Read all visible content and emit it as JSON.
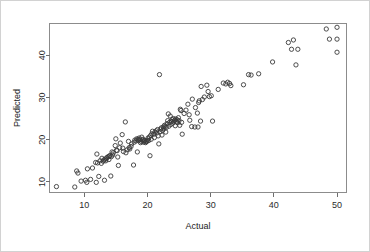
{
  "figure": {
    "background_color": "#ffffff",
    "frame_color": "#8c8c8c",
    "outer_border_color": "#d2d2d2",
    "point_color": "#3a3a3a"
  },
  "chart_data": {
    "type": "scatter",
    "title": "",
    "xlabel": "Actual",
    "ylabel": "Predicted",
    "xlim": [
      4.5,
      51.5
    ],
    "ylim": [
      7.5,
      47.5
    ],
    "xticks": [
      10,
      20,
      30,
      40,
      50
    ],
    "yticks": [
      10,
      20,
      30,
      40
    ],
    "xtick_labels": [
      "10",
      "20",
      "30",
      "40",
      "50"
    ],
    "ytick_labels": [
      "10",
      "20",
      "30",
      "40"
    ],
    "grid": false,
    "legend": null,
    "marker": "open-circle",
    "marker_size": 3.1,
    "series": [
      {
        "name": "Predicted vs Actual",
        "points": [
          [
            5.6,
            8.9
          ],
          [
            8.5,
            8.8
          ],
          [
            8.8,
            12.6
          ],
          [
            9.0,
            12.1
          ],
          [
            9.5,
            10.2
          ],
          [
            10.2,
            10.4
          ],
          [
            10.4,
            9.9
          ],
          [
            10.5,
            13.1
          ],
          [
            11.0,
            10.6
          ],
          [
            11.3,
            13.3
          ],
          [
            11.8,
            14.6
          ],
          [
            11.9,
            9.9
          ],
          [
            12.0,
            16.6
          ],
          [
            12.1,
            14.5
          ],
          [
            12.3,
            11.3
          ],
          [
            12.5,
            15.0
          ],
          [
            12.7,
            14.4
          ],
          [
            12.8,
            15.6
          ],
          [
            13.0,
            14.9
          ],
          [
            13.1,
            15.2
          ],
          [
            13.2,
            10.4
          ],
          [
            13.3,
            15.4
          ],
          [
            13.4,
            15.0
          ],
          [
            13.5,
            15.5
          ],
          [
            13.6,
            15.8
          ],
          [
            13.8,
            16.0
          ],
          [
            13.9,
            15.3
          ],
          [
            14.0,
            16.1
          ],
          [
            14.1,
            16.3
          ],
          [
            14.2,
            11.4
          ],
          [
            14.3,
            16.0
          ],
          [
            14.4,
            17.1
          ],
          [
            14.5,
            16.4
          ],
          [
            14.6,
            16.9
          ],
          [
            14.9,
            18.6
          ],
          [
            15.0,
            20.2
          ],
          [
            15.1,
            17.5
          ],
          [
            15.2,
            17.4
          ],
          [
            15.3,
            15.9
          ],
          [
            15.4,
            13.9
          ],
          [
            15.6,
            18.1
          ],
          [
            15.7,
            19.2
          ],
          [
            16.0,
            21.2
          ],
          [
            16.1,
            18.0
          ],
          [
            16.2,
            17.2
          ],
          [
            16.5,
            24.2
          ],
          [
            16.6,
            16.9
          ],
          [
            16.8,
            17.6
          ],
          [
            17.0,
            19.6
          ],
          [
            17.1,
            18.1
          ],
          [
            17.2,
            17.8
          ],
          [
            17.4,
            18.4
          ],
          [
            17.5,
            19.0
          ],
          [
            17.8,
            14.0
          ],
          [
            17.9,
            19.4
          ],
          [
            18.0,
            19.9
          ],
          [
            18.2,
            19.7
          ],
          [
            18.3,
            20.2
          ],
          [
            18.4,
            17.1
          ],
          [
            18.5,
            20.1
          ],
          [
            18.6,
            19.8
          ],
          [
            18.7,
            20.4
          ],
          [
            18.8,
            20.0
          ],
          [
            18.9,
            19.3
          ],
          [
            19.0,
            19.6
          ],
          [
            19.1,
            20.6
          ],
          [
            19.2,
            19.9
          ],
          [
            19.3,
            20.1
          ],
          [
            19.4,
            19.4
          ],
          [
            19.5,
            19.7
          ],
          [
            19.6,
            19.8
          ],
          [
            19.7,
            19.3
          ],
          [
            19.8,
            19.5
          ],
          [
            19.9,
            19.6
          ],
          [
            20.0,
            19.9
          ],
          [
            20.1,
            20.4
          ],
          [
            20.2,
            19.8
          ],
          [
            20.3,
            20.6
          ],
          [
            20.4,
            16.2
          ],
          [
            20.5,
            21.0
          ],
          [
            20.6,
            20.1
          ],
          [
            20.7,
            21.4
          ],
          [
            20.8,
            22.0
          ],
          [
            21.0,
            21.3
          ],
          [
            21.1,
            20.5
          ],
          [
            21.2,
            21.8
          ],
          [
            21.4,
            22.1
          ],
          [
            21.5,
            21.6
          ],
          [
            21.6,
            22.4
          ],
          [
            21.7,
            20.9
          ],
          [
            21.8,
            19.0
          ],
          [
            21.9,
            35.4
          ],
          [
            22.0,
            21.9
          ],
          [
            22.1,
            22.5
          ],
          [
            22.2,
            22.8
          ],
          [
            22.3,
            21.1
          ],
          [
            22.4,
            22.2
          ],
          [
            22.5,
            23.0
          ],
          [
            22.6,
            22.6
          ],
          [
            22.7,
            23.4
          ],
          [
            22.8,
            23.1
          ],
          [
            22.9,
            21.8
          ],
          [
            23.0,
            22.9
          ],
          [
            23.1,
            23.8
          ],
          [
            23.2,
            24.5
          ],
          [
            23.3,
            26.1
          ],
          [
            23.4,
            23.2
          ],
          [
            23.5,
            24.1
          ],
          [
            23.6,
            25.6
          ],
          [
            23.7,
            23.6
          ],
          [
            23.8,
            24.3
          ],
          [
            23.9,
            24.8
          ],
          [
            24.0,
            23.9
          ],
          [
            24.1,
            25.0
          ],
          [
            24.2,
            24.4
          ],
          [
            24.3,
            24.6
          ],
          [
            24.4,
            23.3
          ],
          [
            24.5,
            24.9
          ],
          [
            24.6,
            24.2
          ],
          [
            24.7,
            24.7
          ],
          [
            24.8,
            24.0
          ],
          [
            24.9,
            25.2
          ],
          [
            25.0,
            24.5
          ],
          [
            25.1,
            23.4
          ],
          [
            25.2,
            27.2
          ],
          [
            25.3,
            26.9
          ],
          [
            25.4,
            24.1
          ],
          [
            25.5,
            21.3
          ],
          [
            25.8,
            26.2
          ],
          [
            26.1,
            27.0
          ],
          [
            26.4,
            28.4
          ],
          [
            26.6,
            25.9
          ],
          [
            26.7,
            24.6
          ],
          [
            27.0,
            23.1
          ],
          [
            27.1,
            29.6
          ],
          [
            27.5,
            23.0
          ],
          [
            27.6,
            27.6
          ],
          [
            27.9,
            26.3
          ],
          [
            28.0,
            23.0
          ],
          [
            28.1,
            28.8
          ],
          [
            28.2,
            29.2
          ],
          [
            28.4,
            24.4
          ],
          [
            28.5,
            32.6
          ],
          [
            28.7,
            29.5
          ],
          [
            29.0,
            30.1
          ],
          [
            29.4,
            32.9
          ],
          [
            29.6,
            31.4
          ],
          [
            29.8,
            30.2
          ],
          [
            30.1,
            30.4
          ],
          [
            30.3,
            24.4
          ],
          [
            31.2,
            31.9
          ],
          [
            32.0,
            33.4
          ],
          [
            32.4,
            33.2
          ],
          [
            32.7,
            33.6
          ],
          [
            33.0,
            33.3
          ],
          [
            33.2,
            32.8
          ],
          [
            35.2,
            33.0
          ],
          [
            36.0,
            35.4
          ],
          [
            36.4,
            35.3
          ],
          [
            37.6,
            35.6
          ],
          [
            39.8,
            38.4
          ],
          [
            42.3,
            43.0
          ],
          [
            42.8,
            41.4
          ],
          [
            43.1,
            43.6
          ],
          [
            43.5,
            37.7
          ],
          [
            43.8,
            41.4
          ],
          [
            48.3,
            46.2
          ],
          [
            48.8,
            43.8
          ],
          [
            50.0,
            40.7
          ],
          [
            50.0,
            46.6
          ],
          [
            50.0,
            43.8
          ]
        ]
      }
    ]
  }
}
